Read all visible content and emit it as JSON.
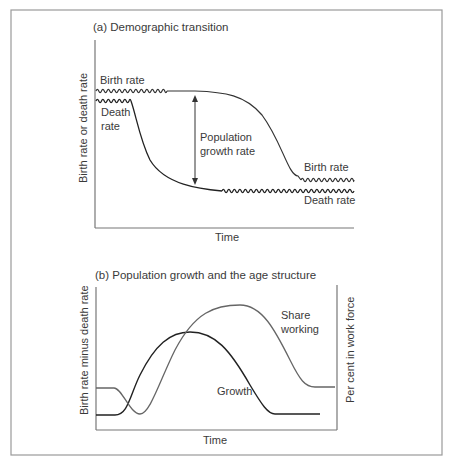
{
  "panel_a": {
    "title": "(a) Demographic transition",
    "ylabel": "Birth rate or death rate",
    "xlabel": "Time",
    "labels": {
      "birth_rate_start": "Birth rate",
      "death_rate_start_line1": "Death",
      "death_rate_start_line2": "rate",
      "growth_line1": "Population",
      "growth_line2": "growth rate",
      "birth_rate_end": "Birth rate",
      "death_rate_end": "Death rate"
    }
  },
  "panel_b": {
    "title": "(b) Population growth and the age structure",
    "ylabel_left": "Birth rate minus death rate",
    "ylabel_right": "Per cent in work force",
    "xlabel": "Time",
    "labels": {
      "share_line1": "Share",
      "share_line2": "working",
      "growth": "Growth"
    }
  },
  "colors": {
    "frame": "#9a9a9a",
    "axis": "#777777",
    "line_dark": "#222222",
    "line_gray": "#666666",
    "text": "#3a3a3a"
  },
  "chart_data": [
    {
      "type": "line",
      "title": "(a) Demographic transition",
      "xlabel": "Time",
      "ylabel": "Birth rate or death rate",
      "grid": false,
      "qualitative": true,
      "x": [
        0,
        0.2,
        0.4,
        0.6,
        0.8,
        1.0
      ],
      "series": [
        {
          "name": "Birth rate",
          "values": [
            0.9,
            0.9,
            0.88,
            0.7,
            0.35,
            0.35
          ],
          "fluctuating_segments": [
            "start",
            "end"
          ]
        },
        {
          "name": "Death rate",
          "values": [
            0.85,
            0.6,
            0.2,
            0.2,
            0.2,
            0.2
          ],
          "fluctuating_segments": [
            "start",
            "end"
          ]
        }
      ],
      "annotations": [
        "Population growth rate"
      ]
    },
    {
      "type": "line",
      "title": "(b) Population growth and the age structure",
      "xlabel": "Time",
      "ylabel": "Birth rate minus death rate",
      "ylabel_right": "Per cent in work force",
      "grid": false,
      "qualitative": true,
      "x": [
        0,
        0.2,
        0.4,
        0.6,
        0.8,
        1.0
      ],
      "series": [
        {
          "name": "Growth",
          "values": [
            0.1,
            0.5,
            0.75,
            0.45,
            0.08,
            0.08
          ]
        },
        {
          "name": "Share working",
          "values": [
            0.35,
            0.15,
            0.7,
            0.95,
            0.45,
            0.3
          ]
        }
      ]
    }
  ]
}
